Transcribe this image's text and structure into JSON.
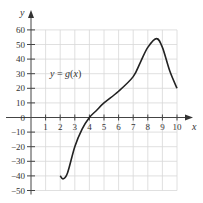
{
  "chart_data": {
    "type": "line",
    "title": "",
    "xlabel": "x",
    "ylabel": "y",
    "annotation": "y = g(x)",
    "xlim": [
      0,
      10
    ],
    "ylim": [
      -50,
      60
    ],
    "grid": true,
    "x_ticks": [
      1,
      2,
      3,
      4,
      5,
      6,
      7,
      8,
      9,
      10
    ],
    "y_ticks": [
      60,
      50,
      40,
      30,
      20,
      10,
      0,
      -10,
      -20,
      -30,
      -40,
      -50
    ],
    "series": [
      {
        "name": "g(x)",
        "x": [
          2,
          2.2,
          2.5,
          3,
          3.5,
          4,
          4.5,
          5,
          6,
          7,
          7.5,
          8,
          8.6,
          9,
          9.5,
          10
        ],
        "y": [
          -40,
          -42,
          -38,
          -20,
          -8,
          0,
          5,
          10,
          18,
          28,
          38,
          48,
          54,
          48,
          32,
          20
        ]
      }
    ]
  },
  "labels": {
    "x_axis": "x",
    "y_axis": "y",
    "function": "y = g(x)"
  }
}
